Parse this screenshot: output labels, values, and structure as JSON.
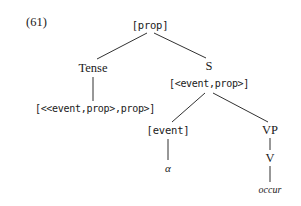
{
  "figure": {
    "example_number": "(61)",
    "kind": "syntax-tree",
    "ink_color": "#1a1a1a",
    "background_color": "#ffffff"
  },
  "tree": {
    "nodes": [
      {
        "id": "root",
        "label": "[prop]",
        "x": 150,
        "y": 25,
        "style": "type"
      },
      {
        "id": "tense",
        "label": "Tense",
        "x": 93,
        "y": 68,
        "style": "serif"
      },
      {
        "id": "tense_type",
        "label": "[<<event,prop>,prop>]",
        "x": 95,
        "y": 109,
        "style": "type-small"
      },
      {
        "id": "s",
        "label": "S",
        "x": 209,
        "y": 66,
        "style": "serif"
      },
      {
        "id": "s_type",
        "label": "[<event,prop>]",
        "x": 209,
        "y": 84,
        "style": "type-small"
      },
      {
        "id": "event",
        "label": "[event]",
        "x": 168,
        "y": 130,
        "style": "type"
      },
      {
        "id": "alpha",
        "label": "α",
        "x": 168,
        "y": 168,
        "style": "greek"
      },
      {
        "id": "vp",
        "label": "VP",
        "x": 270,
        "y": 130,
        "style": "serif"
      },
      {
        "id": "v",
        "label": "V",
        "x": 270,
        "y": 158,
        "style": "serif"
      },
      {
        "id": "occur",
        "label": "occur",
        "x": 270,
        "y": 190,
        "style": "terminal"
      }
    ],
    "edges": [
      {
        "from": "root",
        "to": "tense",
        "x1": 147,
        "y1": 33,
        "x2": 97,
        "y2": 59
      },
      {
        "from": "root",
        "to": "s",
        "x1": 154,
        "y1": 33,
        "x2": 206,
        "y2": 58
      },
      {
        "from": "tense",
        "to": "tense_type",
        "x1": 93,
        "y1": 77,
        "x2": 93,
        "y2": 101
      },
      {
        "from": "s",
        "to": "event",
        "x1": 205,
        "y1": 93,
        "x2": 172,
        "y2": 122
      },
      {
        "from": "s",
        "to": "vp",
        "x1": 213,
        "y1": 93,
        "x2": 268,
        "y2": 122
      },
      {
        "from": "event",
        "to": "alpha",
        "x1": 168,
        "y1": 139,
        "x2": 168,
        "y2": 160
      },
      {
        "from": "vp",
        "to": "v",
        "x1": 270,
        "y1": 138,
        "x2": 270,
        "y2": 150
      },
      {
        "from": "v",
        "to": "occur",
        "x1": 270,
        "y1": 166,
        "x2": 270,
        "y2": 182
      }
    ]
  },
  "labels": {
    "root_type": "[prop]",
    "tense_head": "Tense",
    "tense_semantic_type": "[<<event,prop>,prop>]",
    "s_head": "S",
    "s_semantic_type": "[<event,prop>]",
    "event_type": "[event]",
    "event_variable": "α",
    "vp_head": "VP",
    "v_head": "V",
    "verb_terminal": "occur"
  }
}
